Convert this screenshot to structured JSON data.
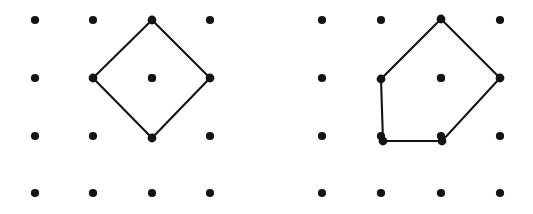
{
  "figure": {
    "background_color": "#ffffff",
    "ink_color": "#141414",
    "dot_radius": 4.1,
    "vertex_dot_radius": 4.4,
    "stroke_width": 2.1,
    "panels": [
      {
        "name": "left-panel",
        "label": "Diamond (square rotated 45 degrees)",
        "grid": {
          "columns": 4,
          "rows": 4,
          "x_positions": [
            35,
            93,
            152,
            210
          ],
          "y_positions": [
            20,
            78,
            136,
            193
          ],
          "dots": [
            {
              "x": 35,
              "y": 20
            },
            {
              "x": 93,
              "y": 20
            },
            {
              "x": 152,
              "y": 20
            },
            {
              "x": 210,
              "y": 20
            },
            {
              "x": 35,
              "y": 78
            },
            {
              "x": 93,
              "y": 78
            },
            {
              "x": 152,
              "y": 78
            },
            {
              "x": 210,
              "y": 78
            },
            {
              "x": 35,
              "y": 136
            },
            {
              "x": 93,
              "y": 136
            },
            {
              "x": 152,
              "y": 136
            },
            {
              "x": 210,
              "y": 136
            },
            {
              "x": 35,
              "y": 193
            },
            {
              "x": 93,
              "y": 193
            },
            {
              "x": 152,
              "y": 193
            },
            {
              "x": 210,
              "y": 193
            }
          ]
        },
        "polygon": {
          "name": "diamond-polygon",
          "vertex_count": 4,
          "interior_points": 1,
          "boundary_points": 4,
          "vertices": [
            {
              "x": 152,
              "y": 20,
              "lattice": [
                2,
                0
              ]
            },
            {
              "x": 210,
              "y": 78,
              "lattice": [
                3,
                1
              ]
            },
            {
              "x": 152,
              "y": 138,
              "lattice": [
                2,
                2
              ]
            },
            {
              "x": 93,
              "y": 78,
              "lattice": [
                1,
                1
              ]
            }
          ]
        },
        "interior_dots": [
          {
            "x": 152,
            "y": 78
          }
        ]
      },
      {
        "name": "right-panel",
        "label": "Irregular pentagon",
        "grid": {
          "columns": 4,
          "rows": 4,
          "x_positions": [
            322,
            381,
            441,
            500
          ],
          "y_positions": [
            20,
            78,
            136,
            193
          ],
          "dots": [
            {
              "x": 322,
              "y": 20
            },
            {
              "x": 381,
              "y": 20
            },
            {
              "x": 441,
              "y": 20
            },
            {
              "x": 500,
              "y": 20
            },
            {
              "x": 322,
              "y": 78
            },
            {
              "x": 381,
              "y": 78
            },
            {
              "x": 441,
              "y": 78
            },
            {
              "x": 500,
              "y": 78
            },
            {
              "x": 322,
              "y": 136
            },
            {
              "x": 381,
              "y": 136
            },
            {
              "x": 441,
              "y": 136
            },
            {
              "x": 500,
              "y": 136
            },
            {
              "x": 322,
              "y": 193
            },
            {
              "x": 381,
              "y": 193
            },
            {
              "x": 441,
              "y": 193
            },
            {
              "x": 500,
              "y": 193
            }
          ]
        },
        "polygon": {
          "name": "pentagon-polygon",
          "vertex_count": 5,
          "interior_points": 1,
          "boundary_points": 5,
          "vertices": [
            {
              "x": 441,
              "y": 19,
              "lattice": [
                2,
                0
              ]
            },
            {
              "x": 500,
              "y": 78,
              "lattice": [
                3,
                1
              ]
            },
            {
              "x": 442,
              "y": 141,
              "lattice": [
                2,
                2
              ]
            },
            {
              "x": 383,
              "y": 141,
              "lattice": [
                1,
                2
              ]
            },
            {
              "x": 381,
              "y": 79,
              "lattice": [
                1,
                1
              ]
            }
          ]
        },
        "interior_dots": [
          {
            "x": 441,
            "y": 78
          }
        ]
      }
    ]
  }
}
